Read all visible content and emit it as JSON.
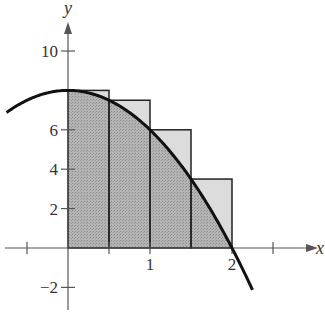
{
  "chart_data": {
    "type": "area",
    "title": "",
    "function": "y = 8 - 2x^2",
    "xlabel": "x",
    "ylabel": "y",
    "xlim": [
      -0.8,
      2.9
    ],
    "ylim": [
      -2.9,
      12
    ],
    "x_ticks": [
      {
        "value": -0.5,
        "label": ""
      },
      {
        "value": 0.5,
        "label": ""
      },
      {
        "value": 1,
        "label": "1"
      },
      {
        "value": 2,
        "label": "2"
      },
      {
        "value": 2.5,
        "label": ""
      }
    ],
    "y_ticks": [
      {
        "value": -2,
        "label": "−2"
      },
      {
        "value": 2,
        "label": "2"
      },
      {
        "value": 4,
        "label": "4"
      },
      {
        "value": 6,
        "label": "6"
      },
      {
        "value": 10,
        "label": "10"
      }
    ],
    "rectangles": [
      {
        "x0": 0,
        "x1": 0.5,
        "height": 8
      },
      {
        "x0": 0.5,
        "x1": 1,
        "height": 7.5
      },
      {
        "x0": 1,
        "x1": 1.5,
        "height": 6
      },
      {
        "x0": 1.5,
        "x1": 2,
        "height": 3.5
      }
    ],
    "shaded_region": {
      "from": 0,
      "to": 2,
      "under": "curve"
    },
    "curve_range": [
      -0.75,
      2.25
    ],
    "colors": {
      "curve": "#111111",
      "area": "#a9a9a9",
      "rect_fill": "#dcdcdc",
      "axis": "#555555"
    }
  }
}
